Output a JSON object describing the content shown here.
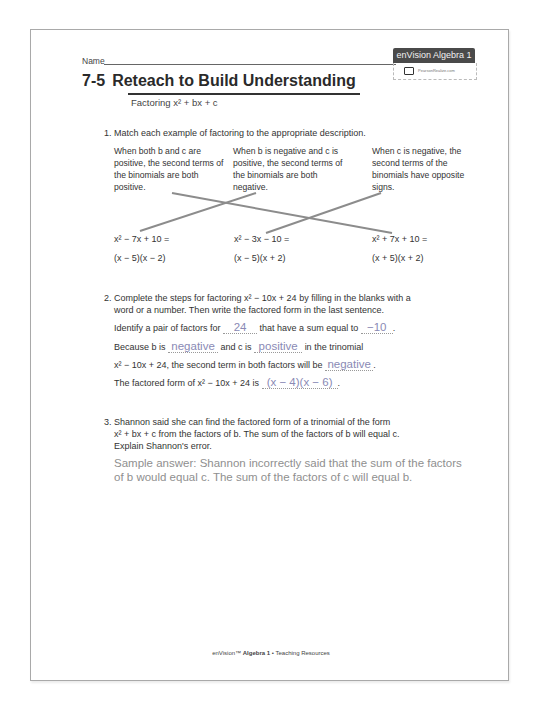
{
  "header": {
    "name_label": "Name",
    "brand_badge": "enVision Algebra 1",
    "brand_sub": "PearsonRealize.com",
    "lesson_number": "7-5",
    "lesson_title": "Reteach to Build Understanding",
    "subtitle": "Factoring x² + bx + c"
  },
  "q1": {
    "number": "1.",
    "prompt": "Match each example of factoring to the appropriate description.",
    "descriptions": [
      "When both b and c are positive, the second terms of the binomials are both positive.",
      "When b is negative and c is positive, the second terms of the binomials are both negative.",
      "When c is negative, the second terms of the binomials have opposite signs."
    ],
    "examples": [
      {
        "expr": "x² − 7x + 10 =",
        "factored": "(x − 5)(x − 2)"
      },
      {
        "expr": "x² − 3x − 10 =",
        "factored": "(x − 5)(x + 2)"
      },
      {
        "expr": "x² + 7x + 10 =",
        "factored": "(x + 5)(x + 2)"
      }
    ],
    "matches": [
      {
        "description": 0,
        "example": 2
      },
      {
        "description": 1,
        "example": 0
      },
      {
        "description": 2,
        "example": 1
      }
    ]
  },
  "q2": {
    "number": "2.",
    "prompt_line1": "Complete the steps for factoring x² − 10x + 24 by filling in the blanks with a",
    "prompt_line2": "word or a number. Then write the factored form in the last sentence.",
    "s1_a": "Identify a pair of factors for",
    "blank1": "24",
    "s1_b": "that have a sum equal to",
    "blank2": "−10",
    "s2_a": "Because b is",
    "blank3": "negative",
    "s2_b": "and c is",
    "blank4": "positive",
    "s2_c": "in the trinomial",
    "s3_a": "x² − 10x + 24, the second term in both factors will be",
    "blank5": "negative",
    "s4_a": "The factored form of x² − 10x + 24 is",
    "blank6": "(x − 4)(x − 6)"
  },
  "q3": {
    "number": "3.",
    "line1": "Shannon said she can find the factored form of a trinomial of the form",
    "line2": "x² + bx + c from the factors of b. The sum of the factors of b will equal c.",
    "line3": "Explain Shannon's error.",
    "answer": "Sample answer: Shannon incorrectly said that the sum of the factors of b would equal c. The sum of the factors of c will equal b."
  },
  "footer": {
    "brand": "enVision™",
    "book": "Algebra 1",
    "sep": "•",
    "section": "Teaching Resources"
  },
  "colors": {
    "answer_text": "#8f8f8f",
    "badge_bg": "#4a4a4a",
    "match_line": "#8c8c8c"
  }
}
